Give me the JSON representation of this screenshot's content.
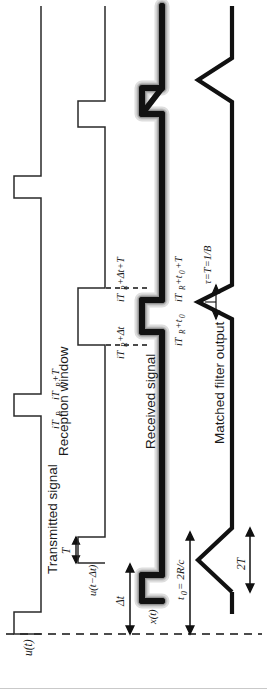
{
  "figure": {
    "orientation": "rotated-90-ccw",
    "width": 267,
    "height": 692,
    "colors": {
      "ink": "#1a1a1a",
      "thin_trace": "#2a2a2a",
      "thick_trace": "#111111",
      "glow": "#b8b8b8",
      "dashed": "#111111",
      "background": "#ffffff",
      "bottom_rule": "#c9c9c9"
    }
  },
  "traces": {
    "transmitted": {
      "name": "Transmitted signal",
      "style": "thin",
      "pulses": 3
    },
    "reception": {
      "name": "Reception window",
      "style": "thin",
      "pulses": 3
    },
    "received": {
      "name": "Received signal",
      "style": "thick-with-glow",
      "pulses": 3
    },
    "matched": {
      "name": "Matched filter output",
      "style": "thick",
      "peaks": 3
    }
  },
  "labels": {
    "transmitted_signal": "Transmitted signal",
    "reception_window": "Reception window",
    "received_signal": "Received signal",
    "matched_filter_output": "Matched filter output",
    "u_t": "u(t)",
    "u_t_minus_dt": "u(t−Δt)",
    "x_t": "x(t)",
    "T": "T",
    "two_T": "2T",
    "delta_t": "Δt",
    "t0_def": "t₀ = 2R/c",
    "tau_def": "τ=T=1/B",
    "iTR": "iT",
    "iTR_sub": "R",
    "iTR_plus_T": "iT",
    "tick_iTR": "iT_R",
    "tick_iTR_T": "iT_R+T",
    "tick_iTR_dt": "iT_R+Δt",
    "tick_iTR_dt_T": "iT_R+Δt+T",
    "tick_iTR_t0": "iT_R+t₀",
    "tick_iTR_t0_T": "iT_R+t₀+T"
  },
  "math": {
    "iTR_parts": {
      "base": "iT",
      "sub": "R"
    },
    "iTR_T_parts": {
      "base": "iT",
      "sub": "R",
      "tail": "+T"
    },
    "iTR_dt_parts": {
      "base": "iT",
      "sub": "R",
      "tail": "+Δt"
    },
    "iTR_dt_T_parts": {
      "base": "iT",
      "sub": "R",
      "tail": "+Δt+T"
    },
    "iTR_t0_parts": {
      "base": "iT",
      "sub": "R",
      "tail": "+t",
      "sub2": "0"
    },
    "iTR_t0_T_parts": {
      "base": "iT",
      "sub": "R",
      "tail": "+t",
      "sub2": "0",
      "tail2": "+T"
    },
    "t0_parts": {
      "base": "t",
      "sub": "0",
      "tail": " = 2R/c"
    },
    "tau_parts": {
      "text": "τ=T=1/B"
    },
    "u_t_parts": {
      "text": "u(t)"
    },
    "u_dt_parts": {
      "text": "u(t−Δt)"
    },
    "x_t_parts": {
      "text": "x(t)"
    }
  }
}
